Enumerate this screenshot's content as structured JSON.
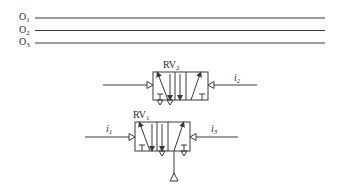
{
  "outputs": [
    {
      "base": "O",
      "sub": "1"
    },
    {
      "base": "O",
      "sub": "2"
    },
    {
      "base": "O",
      "sub": "3"
    }
  ],
  "valves": [
    {
      "id": "rv2",
      "base": "RV",
      "sub": "2",
      "input_right": {
        "base": "i",
        "sub": "2"
      }
    },
    {
      "id": "rv1",
      "base": "RV",
      "sub": "1",
      "input_left": {
        "base": "i",
        "sub": "1"
      },
      "input_right": {
        "base": "i",
        "sub": "3"
      }
    }
  ],
  "colors": {
    "stroke": "#3a3a3a",
    "background": "#ffffff"
  }
}
